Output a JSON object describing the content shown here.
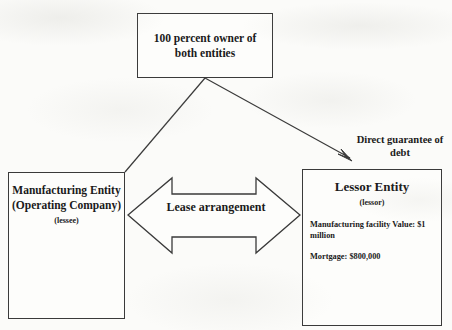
{
  "diagram": {
    "background_color": "#fbfbf9",
    "line_color": "#3a3a3a",
    "text_color": "#1a1a1a"
  },
  "owner_box": {
    "text": "100 percent owner of both entities"
  },
  "manufacturing_box": {
    "title": "Manufacturing Entity (Operating Company)",
    "role": "(lessee)"
  },
  "lessor_box": {
    "title": "Lessor Entity",
    "role": "(lessor)",
    "details": [
      "Manufacturing facility Value: $1 million",
      "Mortgage: $800,000"
    ]
  },
  "lease_arrow": {
    "label": "Lease arrangement"
  },
  "guarantee_arrow": {
    "label": "Direct guarantee of debt"
  }
}
